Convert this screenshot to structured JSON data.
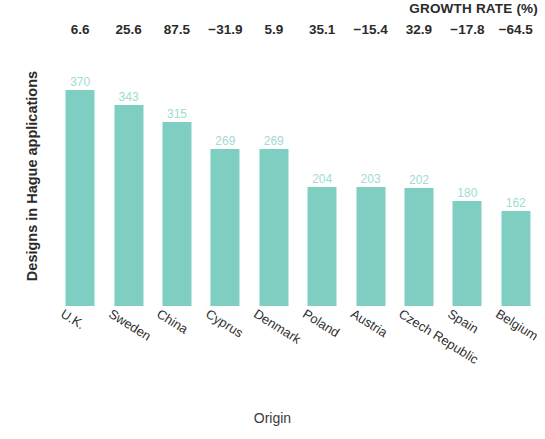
{
  "chart_data": {
    "type": "bar",
    "title": "",
    "xlabel": "Origin",
    "ylabel": "Designs in Hague applications",
    "ylim": [
      0,
      400
    ],
    "grid": false,
    "legend": null,
    "bar_color": "#7ecfc1",
    "value_label_color": "#9fdcd2",
    "categories": [
      "U.K.",
      "Sweden",
      "China",
      "Cyprus",
      "Denmark",
      "Poland",
      "Austria",
      "Czech Republic",
      "Spain",
      "Belgium"
    ],
    "values": [
      370,
      343,
      315,
      269,
      269,
      204,
      203,
      202,
      180,
      162
    ],
    "annotation_row": {
      "label": "GROWTH RATE (%)",
      "values": [
        "6.6",
        "25.6",
        "87.5",
        "−31.9",
        "5.9",
        "35.1",
        "−15.4",
        "32.9",
        "−17.8",
        "−64.5"
      ]
    },
    "series": [
      {
        "name": "Designs in Hague applications",
        "values": [
          370,
          343,
          315,
          269,
          269,
          204,
          203,
          202,
          180,
          162
        ]
      },
      {
        "name": "Growth rate (%)",
        "values": [
          6.6,
          25.6,
          87.5,
          -31.9,
          5.9,
          35.1,
          -15.4,
          32.9,
          -17.8,
          -64.5
        ]
      }
    ]
  }
}
